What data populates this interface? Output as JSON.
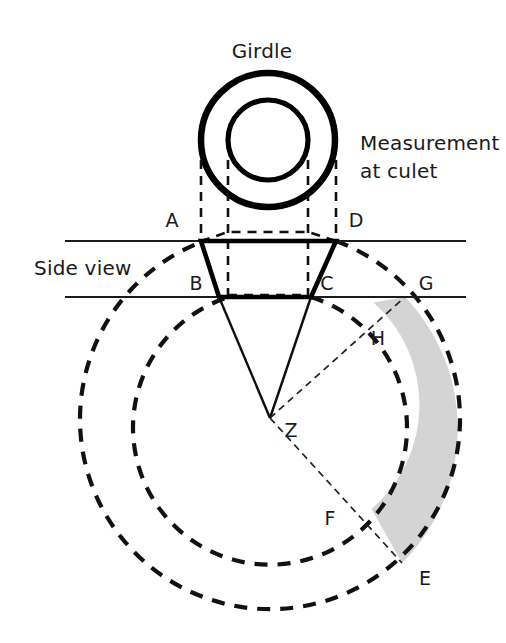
{
  "figure": {
    "type": "diagram",
    "background_color": "#ffffff",
    "line_color": "#111111",
    "shade_color": "#d4d4d4",
    "width": 506,
    "height": 643
  },
  "captions": {
    "girdle": "Girdle",
    "measurement_line1": "Measurement",
    "measurement_line2": "at culet",
    "side_view": "Side view"
  },
  "points": [
    {
      "id": "A",
      "label": "A",
      "x": 172,
      "y": 220,
      "role": "crown-table-left"
    },
    {
      "id": "D",
      "label": "D",
      "x": 356,
      "y": 220,
      "role": "crown-table-right"
    },
    {
      "id": "B",
      "label": "B",
      "x": 196,
      "y": 283,
      "role": "girdle-left"
    },
    {
      "id": "C",
      "label": "C",
      "x": 327,
      "y": 283,
      "role": "girdle-right"
    },
    {
      "id": "G",
      "label": "G",
      "x": 426,
      "y": 283,
      "role": "outer-arc-on-girdle-line"
    },
    {
      "id": "H",
      "label": "H",
      "x": 378,
      "y": 338,
      "role": "inner-arc-point"
    },
    {
      "id": "Z",
      "label": "Z",
      "x": 291,
      "y": 430,
      "role": "culet-center"
    },
    {
      "id": "F",
      "label": "F",
      "x": 330,
      "y": 518,
      "role": "inner-arc-lower-point"
    },
    {
      "id": "E",
      "label": "E",
      "x": 425,
      "y": 578,
      "role": "outer-arc-lower-point"
    }
  ],
  "geometry": {
    "girdle_plan": {
      "center_x": 268,
      "center_y": 140,
      "outer_radius": 67,
      "inner_radius": 40
    },
    "projection_lines_x": [
      201,
      228,
      308,
      336
    ],
    "horizontal_lines": [
      {
        "name": "table-plane",
        "y": 241,
        "x1": 65,
        "x2": 466
      },
      {
        "name": "girdle-plane",
        "y": 297,
        "x1": 65,
        "x2": 466
      }
    ],
    "crown": {
      "ax": 201,
      "ay": 241,
      "dx": 336,
      "dy": 241,
      "bx": 219,
      "by": 297,
      "cx": 311,
      "cy": 297
    },
    "culet": {
      "x": 270,
      "y": 418
    },
    "arcs": {
      "outer_radius": 190,
      "inner_radius": 137
    }
  }
}
